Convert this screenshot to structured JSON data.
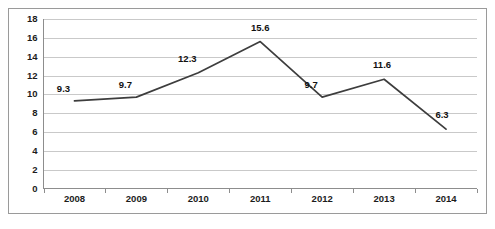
{
  "chart_data": {
    "type": "line",
    "title": "",
    "subtitle": "",
    "xlabel": "",
    "ylabel": "",
    "categories": [
      "2008",
      "2009",
      "2010",
      "2011",
      "2012",
      "2013",
      "2014"
    ],
    "values": [
      9.3,
      9.7,
      12.3,
      15.6,
      9.7,
      11.6,
      6.3
    ],
    "point_labels": [
      "9.3",
      "9.7",
      "12.3",
      "15.6",
      "9.7",
      "11.6",
      "6.3"
    ],
    "ylim": [
      0,
      18
    ],
    "ytick_step": 2,
    "ytick_labels": [
      "0",
      "2",
      "4",
      "6",
      "8",
      "10",
      "12",
      "14",
      "16",
      "18"
    ],
    "grid": "horizontal",
    "legend": "none",
    "series": [
      {
        "name": "series-1",
        "values": [
          9.3,
          9.7,
          12.3,
          15.6,
          9.7,
          11.6,
          6.3
        ],
        "color": "#3d3d3d"
      }
    ],
    "colors": {
      "line": "#3d3d3d",
      "gridline": "#c9c9c9",
      "axis": "#8d8d8d",
      "border": "#9a9a9a",
      "text": "#1c1c1c",
      "background": "#ffffff"
    }
  }
}
